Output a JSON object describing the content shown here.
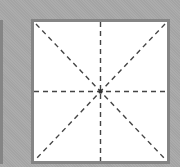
{
  "diagram": {
    "type": "guide-grid-squares",
    "colors": {
      "background": "#a9a9a9",
      "square_fill": "#ffffff",
      "square_border": "#858585",
      "guide_line": "#444444",
      "center_dot": "#333333"
    },
    "guide_line_style": "dashed",
    "guide_lines": [
      "horizontal-center",
      "vertical-center",
      "diagonal-tl-br",
      "diagonal-tr-bl"
    ],
    "squares": [
      {
        "id": "left",
        "visibility": "partially-visible (right edge only)"
      },
      {
        "id": "right",
        "visibility": "fully-visible",
        "has_center_dot": true
      }
    ]
  }
}
